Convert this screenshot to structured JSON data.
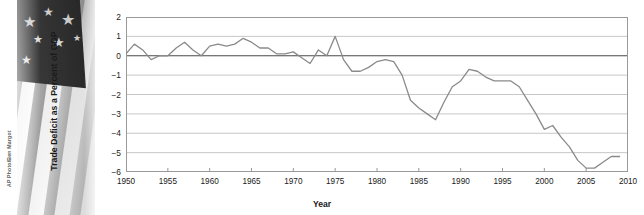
{
  "photo": {
    "credit": "AP Photo/Ben Margot",
    "subject": "us-flag-photograph"
  },
  "chart_data": {
    "type": "line",
    "title": "",
    "xlabel": "Year",
    "ylabel": "Trade Deficit as a Percent of GDP",
    "xlim": [
      1950,
      2010
    ],
    "ylim": [
      -6,
      2
    ],
    "xticks": [
      "1950",
      "1955",
      "1960",
      "1965",
      "1970",
      "1975",
      "1980",
      "1985",
      "1990",
      "1995",
      "2000",
      "2005",
      "2010"
    ],
    "yticks": [
      "2",
      "1",
      "0",
      "-1",
      "-2",
      "-3",
      "-4",
      "-5",
      "-6"
    ],
    "grid": true,
    "legend": "none",
    "line_color": "#8a8a8a",
    "zero_line_color": "#4a4a4a",
    "x": [
      1950,
      1951,
      1952,
      1953,
      1954,
      1955,
      1956,
      1957,
      1958,
      1959,
      1960,
      1961,
      1962,
      1963,
      1964,
      1965,
      1966,
      1967,
      1968,
      1969,
      1970,
      1971,
      1972,
      1973,
      1974,
      1975,
      1976,
      1977,
      1978,
      1979,
      1980,
      1981,
      1982,
      1983,
      1984,
      1985,
      1986,
      1987,
      1988,
      1989,
      1990,
      1991,
      1992,
      1993,
      1994,
      1995,
      1996,
      1997,
      1998,
      1999,
      2000,
      2001,
      2002,
      2003,
      2004,
      2005,
      2006,
      2007,
      2008,
      2009
    ],
    "values": [
      0.1,
      0.6,
      0.3,
      -0.2,
      0.0,
      0.0,
      0.4,
      0.7,
      0.3,
      0.0,
      0.5,
      0.6,
      0.5,
      0.6,
      0.9,
      0.7,
      0.4,
      0.4,
      0.1,
      0.1,
      0.2,
      -0.1,
      -0.4,
      0.3,
      0.0,
      1.0,
      -0.2,
      -0.8,
      -0.8,
      -0.6,
      -0.3,
      -0.2,
      -0.3,
      -1.0,
      -2.3,
      -2.7,
      -3.0,
      -3.3,
      -2.4,
      -1.6,
      -1.3,
      -0.7,
      -0.8,
      -1.1,
      -1.3,
      -1.3,
      -1.3,
      -1.6,
      -2.3,
      -3.0,
      -3.8,
      -3.6,
      -4.2,
      -4.7,
      -5.4,
      -5.8,
      -5.8,
      -5.5,
      -5.2,
      -5.2
    ],
    "annotations": []
  }
}
